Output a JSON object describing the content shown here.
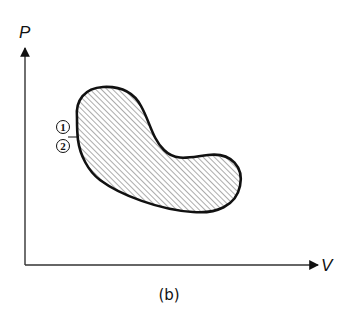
{
  "diagram": {
    "type": "pv-cycle",
    "y_axis_label": "P",
    "x_axis_label": "V",
    "caption": "(b)",
    "region": "closed-cycle-hatched",
    "state_labels": [
      {
        "id": "1",
        "text": "1"
      },
      {
        "id": "2",
        "text": "2"
      }
    ],
    "colors": {
      "stroke": "#111111",
      "hatch": "#555555",
      "background": "#ffffff"
    }
  }
}
